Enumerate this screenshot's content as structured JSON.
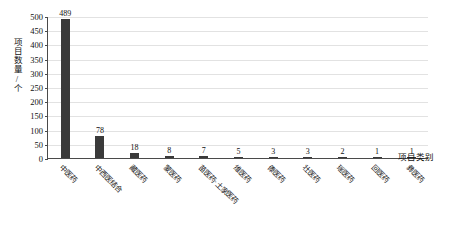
{
  "chart_data": {
    "type": "bar",
    "title": "",
    "subtitle": "",
    "xlabel": "项目类别",
    "ylabel": "项目数量/个",
    "categories": [
      "中医药",
      "中西医结合",
      "藏医药",
      "蒙医药",
      "苗医药·土家医药",
      "维医药",
      "傣医药",
      "壮医药",
      "瑶医药",
      "回医药",
      "彝医药"
    ],
    "values": [
      489,
      78,
      18,
      8,
      7,
      5,
      3,
      3,
      2,
      1,
      1
    ],
    "value_labels": [
      "489",
      "78",
      "18",
      "8",
      "7",
      "5",
      "3",
      "3",
      "2",
      "1",
      "1"
    ],
    "ylim": [
      0,
      500
    ],
    "ytick_step": 50,
    "ytick_labels": [
      "0",
      "50",
      "100",
      "150",
      "200",
      "250",
      "300",
      "350",
      "400",
      "450",
      "500"
    ],
    "grid": true,
    "legend": "none",
    "bar_color": "#3a3a3a",
    "grid_color": "#e2e2e2",
    "axis_color": "#4a4a4a"
  }
}
